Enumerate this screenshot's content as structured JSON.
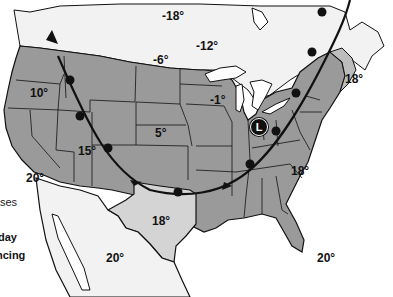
{
  "map": {
    "type": "weather-map",
    "region": "North America (USA, southern Canada, northern Mexico)",
    "colors": {
      "us_land": "#9a9a9a",
      "texas": "#d4d4d4",
      "canada_mexico": "#f2f2f2",
      "new_england_light": "#bdbdbd",
      "water": "#ffffff",
      "borders": "#111111",
      "front": "#111111"
    },
    "pressure_systems": [
      {
        "symbol": "L",
        "label": "Low pressure center",
        "x": 258,
        "y": 127
      }
    ],
    "fronts": [
      {
        "type": "cold-front",
        "description": "Line with triangles through Pacific Northwest"
      },
      {
        "type": "warm-front",
        "description": "Curved line with semicircles from Southwest through Oklahoma to Northeast"
      }
    ],
    "temperatures": [
      {
        "value": "-18°",
        "x": 162,
        "y": 10
      },
      {
        "value": "-12°",
        "x": 196,
        "y": 40
      },
      {
        "value": "-6°",
        "x": 153,
        "y": 54
      },
      {
        "value": "18°",
        "x": 345,
        "y": 73
      },
      {
        "value": "10°",
        "x": 30,
        "y": 87
      },
      {
        "value": "-1°",
        "x": 210,
        "y": 94
      },
      {
        "value": "5°",
        "x": 155,
        "y": 127
      },
      {
        "value": "15°",
        "x": 78,
        "y": 145
      },
      {
        "value": "18°",
        "x": 291,
        "y": 165
      },
      {
        "value": "20°",
        "x": 26,
        "y": 172
      },
      {
        "value": "18°",
        "x": 152,
        "y": 215
      },
      {
        "value": "20°",
        "x": 106,
        "y": 252
      },
      {
        "value": "20°",
        "x": 317,
        "y": 252
      }
    ]
  },
  "side_text": {
    "line1": "ses",
    "line2": "day",
    "line3": "ncing"
  }
}
